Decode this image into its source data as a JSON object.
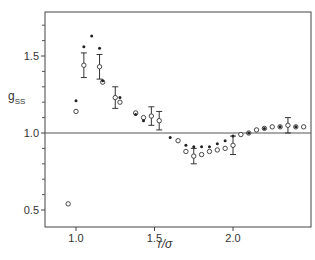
{
  "chart_data": {
    "type": "scatter",
    "title": "",
    "xlabel": "r/σ",
    "ylabel": "g_SS",
    "xlim": [
      0.81,
      2.49
    ],
    "ylim": [
      0.36,
      1.76
    ],
    "grid": false,
    "reference_line": {
      "y": 1.0
    },
    "x_ticks": [
      1.0,
      1.5,
      2.0
    ],
    "x_tick_labels": [
      "1.0",
      "1.5",
      "2.0"
    ],
    "y_ticks": [
      0.5,
      1.0,
      1.5
    ],
    "y_tick_labels": [
      "0.5",
      "1.0",
      "1.5"
    ],
    "y_minor_ticks": [
      0.6,
      0.7,
      0.8,
      0.9,
      1.1,
      1.2,
      1.3,
      1.4,
      1.6,
      1.7
    ],
    "series": [
      {
        "name": "open circles",
        "marker": "open-circle",
        "x": [
          0.95,
          1.0,
          1.05,
          1.15,
          1.17,
          1.25,
          1.28,
          1.38,
          1.43,
          1.48,
          1.53,
          1.65,
          1.7,
          1.75,
          1.8,
          1.85,
          1.9,
          1.95,
          2.0,
          2.05,
          2.1,
          2.15,
          2.2,
          2.25,
          2.3,
          2.35,
          2.4,
          2.45
        ],
        "y": [
          0.54,
          1.14,
          1.44,
          1.43,
          1.33,
          1.23,
          1.2,
          1.13,
          1.1,
          1.11,
          1.08,
          0.95,
          0.88,
          0.85,
          0.86,
          0.88,
          0.89,
          0.9,
          0.92,
          0.99,
          1.0,
          1.02,
          1.03,
          1.04,
          1.04,
          1.05,
          1.04,
          1.04
        ],
        "error": [
          0,
          0,
          0.08,
          0.08,
          0,
          0.07,
          0,
          0,
          0,
          0.06,
          0.06,
          0,
          0,
          0.05,
          0,
          0,
          0,
          0,
          0.06,
          0,
          0,
          0,
          0,
          0,
          0,
          0.05,
          0,
          0
        ]
      },
      {
        "name": "filled dots",
        "marker": "filled-dot",
        "x": [
          1.0,
          1.05,
          1.1,
          1.15,
          1.17,
          1.28,
          1.38,
          1.43,
          1.6,
          1.7,
          1.75,
          1.8,
          1.85,
          1.9,
          1.95,
          2.0,
          2.1,
          2.2,
          2.3,
          2.4
        ],
        "y": [
          1.21,
          1.56,
          1.63,
          1.55,
          1.34,
          1.23,
          1.12,
          1.08,
          0.97,
          0.92,
          0.91,
          0.91,
          0.91,
          0.93,
          0.95,
          0.98,
          1.0,
          1.03,
          1.04,
          1.04
        ]
      }
    ]
  },
  "labels": {
    "ylabel_main": "g",
    "ylabel_sub": "SS",
    "xlabel": "r/σ"
  }
}
